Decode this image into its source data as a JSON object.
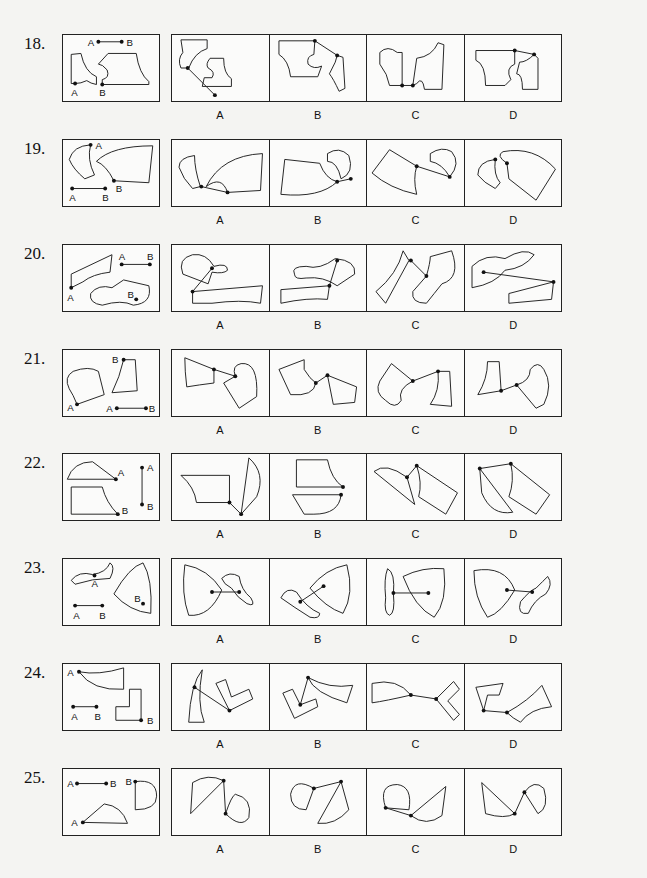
{
  "questions": [
    {
      "number": "18.",
      "options": [
        "A",
        "B",
        "C",
        "D"
      ],
      "prompt_labels": [
        "A",
        "B",
        "A",
        "B"
      ]
    },
    {
      "number": "19.",
      "options": [
        "A",
        "B",
        "C",
        "D"
      ],
      "prompt_labels": [
        "A",
        "B",
        "A",
        "B"
      ]
    },
    {
      "number": "20.",
      "options": [
        "A",
        "B",
        "C",
        "D"
      ],
      "prompt_labels": [
        "A",
        "B",
        "A",
        "B"
      ]
    },
    {
      "number": "21.",
      "options": [
        "A",
        "B",
        "C",
        "D"
      ],
      "prompt_labels": [
        "A",
        "B",
        "A",
        "B"
      ]
    },
    {
      "number": "22.",
      "options": [
        "A",
        "B",
        "C",
        "D"
      ],
      "prompt_labels": [
        "A",
        "B",
        "A",
        "B"
      ]
    },
    {
      "number": "23.",
      "options": [
        "A",
        "B",
        "C",
        "D"
      ],
      "prompt_labels": [
        "A",
        "B",
        "A",
        "B"
      ]
    },
    {
      "number": "24.",
      "options": [
        "A",
        "B",
        "C",
        "D"
      ],
      "prompt_labels": [
        "A",
        "B",
        "A",
        "B"
      ]
    },
    {
      "number": "25.",
      "options": [
        "A",
        "B",
        "C",
        "D"
      ],
      "prompt_labels": [
        "A",
        "B",
        "A",
        "B"
      ]
    }
  ]
}
